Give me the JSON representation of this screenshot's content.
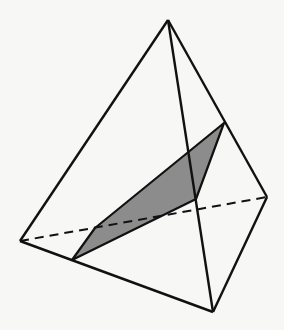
{
  "figure": {
    "type": "tetrahedron-cross-section",
    "colors": {
      "background": "#f7f7f5",
      "stroke": "#111111",
      "shade": "#8c8c8c"
    },
    "vertices": {
      "apex": [
        168,
        20
      ],
      "left": [
        20,
        241
      ],
      "bottom": [
        213,
        312
      ],
      "right": [
        267,
        197
      ]
    },
    "edges_solid": [
      [
        "apex",
        "left"
      ],
      [
        "apex",
        "bottom"
      ],
      [
        "apex",
        "right"
      ],
      [
        "left",
        "bottom"
      ],
      [
        "bottom",
        "right"
      ]
    ],
    "edges_dashed": [
      [
        "left",
        "right"
      ]
    ],
    "section_polygon": [
      [
        72,
        260
      ],
      [
        95,
        228
      ],
      [
        224,
        123
      ],
      [
        196,
        199
      ]
    ]
  }
}
